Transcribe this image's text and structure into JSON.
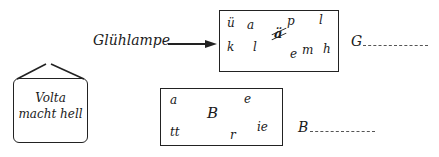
{
  "exercise_1": {
    "label": "Glühlampe",
    "arrow": "→",
    "letters": [
      {
        "char": "ü",
        "x": 8,
        "y": 7
      },
      {
        "char": "a",
        "x": 28,
        "y": 9
      },
      {
        "char": "p",
        "x": 68,
        "y": 5
      },
      {
        "char": "l",
        "x": 100,
        "y": 4
      },
      {
        "char": "k",
        "x": 8,
        "y": 31
      },
      {
        "char": "l",
        "x": 34,
        "y": 31
      },
      {
        "char": "m",
        "x": 86,
        "y": 34
      },
      {
        "char": "h",
        "x": 104,
        "y": 33
      },
      {
        "char": "e",
        "x": 73,
        "y": 38
      }
    ],
    "crossed_letter": "ä",
    "answer_start": "G",
    "answer_line": "............"
  },
  "sign": {
    "line1": "Volta",
    "line2": "macht hell"
  },
  "exercise_2": {
    "letters": [
      {
        "char": "a",
        "x": 10,
        "y": 5
      },
      {
        "char": "B",
        "x": 47,
        "y": 22,
        "size": 15
      },
      {
        "char": "e",
        "x": 84,
        "y": 4
      },
      {
        "char": "tt",
        "x": 10,
        "y": 40
      },
      {
        "char": "r",
        "x": 70,
        "y": 44
      },
      {
        "char": "ie",
        "x": 97,
        "y": 35
      }
    ],
    "answer_start": "B",
    "answer_line": "............"
  }
}
